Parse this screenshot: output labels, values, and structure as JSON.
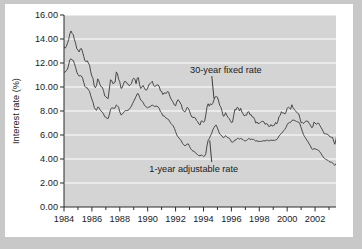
{
  "chart_data": {
    "type": "line",
    "title": "",
    "xlabel": "",
    "ylabel": "Interest rate (%)",
    "ylim": [
      0.0,
      16.0
    ],
    "xlim": [
      1984.0,
      2003.5
    ],
    "ytick_labels": [
      "0.00",
      "2.00",
      "4.00",
      "6.00",
      "8.00",
      "10.00",
      "12.00",
      "14.00",
      "16.00"
    ],
    "ytick_values": [
      0,
      2,
      4,
      6,
      8,
      10,
      12,
      14,
      16
    ],
    "xtick_labels": [
      "1984",
      "1986",
      "1988",
      "1990",
      "1992",
      "1994",
      "1996",
      "1998",
      "2000",
      "2002"
    ],
    "xtick_values": [
      1984,
      1986,
      1988,
      1990,
      1992,
      1994,
      1996,
      1998,
      2000,
      2002
    ],
    "minor_xtick_values": [
      1985,
      1987,
      1989,
      1991,
      1993,
      1995,
      1997,
      1999,
      2001,
      2003
    ],
    "grid": "horizontal-white",
    "legend": "inline-annotations",
    "plot_bgcolor": "#d4d4d4",
    "gridline_color": "#ffffff",
    "line_color": "#3a3a3a",
    "figure_bgcolor": "#ffffff",
    "page_bgcolor": "#c8c8c8",
    "annotations": [
      {
        "text": "30-year fixed rate",
        "series": "30-year fixed rate",
        "x": 1995.6,
        "y": 11.2,
        "point_x": 1994.75,
        "point_y": 9.05
      },
      {
        "text": "1-year adjustable rate",
        "series": "1-year adjustable rate",
        "x": 1993.3,
        "y": 2.95,
        "point_x": 1994.45,
        "point_y": 5.55
      }
    ],
    "series": [
      {
        "name": "30-year fixed rate",
        "x_start": 1984.0,
        "x_step": 0.0833333,
        "values": [
          13.37,
          13.23,
          13.39,
          13.65,
          13.94,
          14.42,
          14.67,
          14.47,
          14.35,
          13.94,
          13.64,
          13.18,
          13.08,
          12.92,
          13.17,
          13.2,
          12.91,
          12.54,
          12.19,
          12.11,
          12.19,
          11.99,
          11.81,
          11.26,
          10.89,
          10.71,
          10.08,
          9.94,
          10.14,
          10.68,
          10.51,
          10.2,
          10.01,
          9.97,
          9.7,
          9.26,
          9.2,
          9.08,
          9.04,
          9.83,
          10.6,
          10.54,
          10.28,
          10.33,
          10.41,
          11.26,
          11.09,
          10.65,
          10.43,
          9.89,
          9.93,
          10.2,
          10.46,
          10.46,
          10.31,
          10.26,
          10.11,
          10.18,
          10.27,
          10.61,
          10.73,
          10.65,
          10.27,
          10.73,
          10.78,
          10.2,
          9.88,
          9.99,
          10.13,
          9.95,
          9.77,
          9.74,
          9.9,
          10.2,
          10.27,
          10.37,
          10.48,
          10.16,
          10.04,
          10.1,
          10.18,
          10.17,
          10.01,
          9.67,
          9.64,
          9.37,
          9.5,
          9.49,
          9.47,
          9.62,
          9.58,
          9.24,
          9.01,
          8.86,
          8.71,
          8.5,
          8.43,
          8.76,
          8.94,
          8.85,
          8.67,
          8.51,
          8.13,
          7.98,
          7.92,
          8.09,
          8.31,
          8.21,
          7.99,
          7.68,
          7.5,
          7.46,
          7.47,
          7.42,
          7.21,
          7.11,
          6.92,
          6.83,
          7.16,
          7.17,
          7.06,
          7.15,
          7.68,
          8.32,
          8.6,
          8.4,
          8.61,
          8.51,
          8.64,
          8.93,
          9.17,
          9.2,
          9.15,
          8.83,
          8.46,
          8.32,
          7.96,
          7.57,
          7.61,
          7.86,
          7.64,
          7.48,
          7.38,
          7.2,
          7.03,
          7.08,
          7.62,
          8.14,
          8.07,
          8.32,
          8.25,
          8.0,
          8.23,
          7.92,
          7.76,
          7.6,
          7.65,
          7.65,
          7.9,
          7.94,
          7.69,
          7.69,
          7.5,
          7.48,
          7.31,
          6.99,
          7.09,
          6.94,
          6.99,
          7.04,
          7.13,
          7.14,
          7.09,
          6.89,
          6.95,
          6.92,
          6.72,
          6.71,
          6.87,
          6.74,
          6.79,
          6.81,
          7.04,
          6.92,
          7.15,
          7.55,
          7.63,
          7.94,
          7.82,
          7.85,
          7.74,
          7.91,
          8.21,
          8.33,
          8.24,
          8.15,
          8.52,
          8.29,
          8.15,
          8.03,
          7.91,
          7.8,
          7.75,
          7.38,
          7.03,
          7.05,
          6.95,
          7.08,
          7.15,
          7.16,
          7.13,
          6.95,
          6.82,
          6.62,
          6.66,
          7.07,
          7.0,
          6.89,
          6.97,
          6.99,
          6.81,
          6.65,
          6.49,
          6.29,
          6.09,
          6.11,
          6.07,
          6.05,
          5.92,
          5.84,
          5.81,
          5.81,
          5.48,
          5.23,
          5.63,
          6.26,
          6.15,
          5.95,
          5.93,
          5.88
        ]
      },
      {
        "name": "1-year adjustable rate",
        "x_start": 1984.0,
        "x_step": 0.0833333,
        "values": [
          11.2,
          11.25,
          11.36,
          11.5,
          11.83,
          12.27,
          12.36,
          12.24,
          12.21,
          11.94,
          11.63,
          11.24,
          11.05,
          10.91,
          10.95,
          10.91,
          10.73,
          10.38,
          10.05,
          9.94,
          9.93,
          9.77,
          9.62,
          9.27,
          8.98,
          8.72,
          8.3,
          8.13,
          8.06,
          8.32,
          8.3,
          8.12,
          7.98,
          7.9,
          7.76,
          7.52,
          7.48,
          7.39,
          7.38,
          7.68,
          8.12,
          8.26,
          8.25,
          8.22,
          8.26,
          8.51,
          8.42,
          8.31,
          7.92,
          7.68,
          7.72,
          7.84,
          7.97,
          8.04,
          8.03,
          8.06,
          8.12,
          8.27,
          8.41,
          8.62,
          8.82,
          9.01,
          9.22,
          9.44,
          9.43,
          9.15,
          8.92,
          8.82,
          8.73,
          8.52,
          8.39,
          8.32,
          8.26,
          8.33,
          8.36,
          8.43,
          8.51,
          8.41,
          8.38,
          8.4,
          8.4,
          8.33,
          8.21,
          7.93,
          7.84,
          7.6,
          7.59,
          7.51,
          7.38,
          7.34,
          7.28,
          7.11,
          6.96,
          6.86,
          6.75,
          6.55,
          6.28,
          6.0,
          5.86,
          5.74,
          5.62,
          5.5,
          5.3,
          5.18,
          5.11,
          5.14,
          5.26,
          5.25,
          5.05,
          4.85,
          4.74,
          4.66,
          4.62,
          4.55,
          4.42,
          4.36,
          4.28,
          4.26,
          4.34,
          4.29,
          4.2,
          4.25,
          4.45,
          5.1,
          5.55,
          5.7,
          5.94,
          6.12,
          6.43,
          6.6,
          6.78,
          6.82,
          6.58,
          6.32,
          6.08,
          5.99,
          5.91,
          5.77,
          5.82,
          5.95,
          5.85,
          5.77,
          5.73,
          5.64,
          5.43,
          5.4,
          5.45,
          5.58,
          5.6,
          5.71,
          5.72,
          5.65,
          5.72,
          5.66,
          5.62,
          5.52,
          5.51,
          5.55,
          5.62,
          5.73,
          5.62,
          5.66,
          5.63,
          5.64,
          5.57,
          5.49,
          5.53,
          5.46,
          5.47,
          5.46,
          5.48,
          5.5,
          5.53,
          5.5,
          5.55,
          5.57,
          5.51,
          5.53,
          5.58,
          5.55,
          5.56,
          5.54,
          5.59,
          5.62,
          5.74,
          5.92,
          6.02,
          6.15,
          6.22,
          6.37,
          6.47,
          6.64,
          6.86,
          7.0,
          7.03,
          7.06,
          7.2,
          7.25,
          7.23,
          7.18,
          7.13,
          7.09,
          7.07,
          6.92,
          6.6,
          6.32,
          6.04,
          5.86,
          5.71,
          5.56,
          5.42,
          5.25,
          5.1,
          4.86,
          4.8,
          4.86,
          4.85,
          4.8,
          4.77,
          4.73,
          4.6,
          4.48,
          4.31,
          4.17,
          4.05,
          3.98,
          3.94,
          3.89,
          3.79,
          3.75,
          3.73,
          3.69,
          3.55,
          3.47,
          3.58,
          3.8,
          3.81,
          3.72,
          3.7,
          3.68
        ]
      }
    ]
  }
}
